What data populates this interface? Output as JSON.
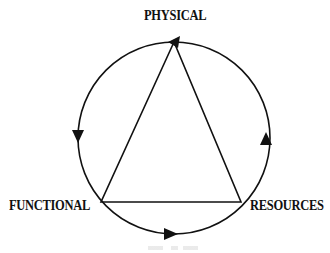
{
  "diagram": {
    "type": "cycle-triangle",
    "nodes": [
      {
        "id": "top",
        "label": "PHYSICAL"
      },
      {
        "id": "left",
        "label": "FUNCTIONAL"
      },
      {
        "id": "right",
        "label": "RESOURCES"
      }
    ],
    "edges": [
      {
        "from": "top",
        "to": "left",
        "style": "triangle-side"
      },
      {
        "from": "left",
        "to": "right",
        "style": "triangle-side"
      },
      {
        "from": "right",
        "to": "top",
        "style": "triangle-side"
      }
    ],
    "cycle_direction": "counterclockwise",
    "cycle_arrows": [
      {
        "position": "top",
        "direction": "left"
      },
      {
        "position": "left",
        "direction": "down"
      },
      {
        "position": "bottom",
        "direction": "right"
      },
      {
        "position": "right",
        "direction": "up"
      }
    ],
    "colors": {
      "stroke": "#111111",
      "background": "#ffffff"
    }
  }
}
